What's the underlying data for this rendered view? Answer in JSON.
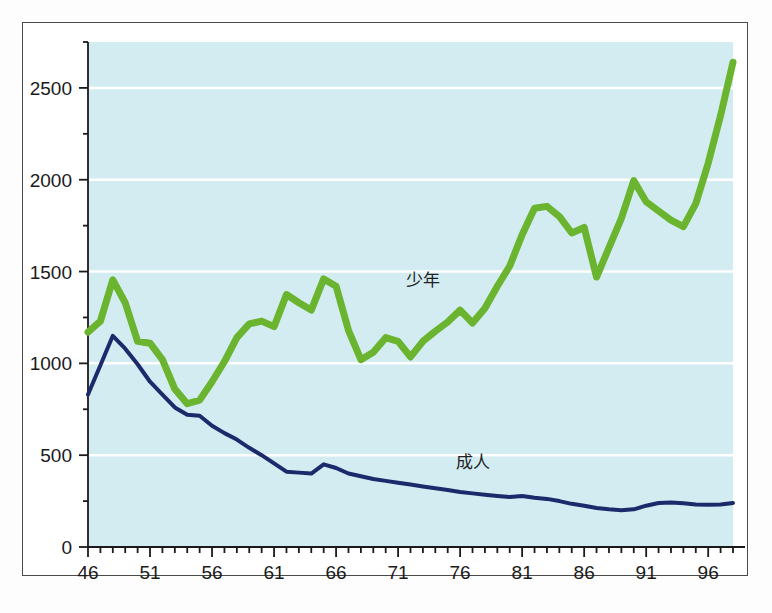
{
  "chart_data": {
    "type": "line",
    "title": "",
    "subtitle": "",
    "xlabel": "",
    "ylabel": "",
    "xlim": [
      46,
      98
    ],
    "ylim": [
      0,
      2750
    ],
    "grid": true,
    "grid_orientation": "horizontal",
    "legend_position": "inline-annotation",
    "plot_background_color": "#d3ecf2",
    "gridline_color": "#ffffff",
    "axis_color": "#1a1a1a",
    "y_ticks_major": [
      0,
      500,
      1000,
      1500,
      2000,
      2500
    ],
    "y_tick_labels": [
      "0",
      "500",
      "1000",
      "1500",
      "2000",
      "2500"
    ],
    "y_ticks_minor_step": 250,
    "x_ticks_major": [
      46,
      51,
      56,
      61,
      66,
      71,
      76,
      81,
      86,
      91,
      96
    ],
    "x_tick_labels": [
      "46",
      "51",
      "56",
      "61",
      "66",
      "71",
      "76",
      "81",
      "86",
      "91",
      "96"
    ],
    "x_ticks_minor_step": 1,
    "x": [
      46,
      47,
      48,
      49,
      50,
      51,
      52,
      53,
      54,
      55,
      56,
      57,
      58,
      59,
      60,
      61,
      62,
      63,
      64,
      65,
      66,
      67,
      68,
      69,
      70,
      71,
      72,
      73,
      74,
      75,
      76,
      77,
      78,
      79,
      80,
      81,
      82,
      83,
      84,
      85,
      86,
      87,
      88,
      89,
      90,
      91,
      92,
      93,
      94,
      95,
      96,
      97,
      98
    ],
    "series": [
      {
        "name": "少年",
        "label": "少年",
        "label_romaji": "shounen",
        "label_meaning": "juvenile",
        "color": "#6ab42f",
        "line_width": 7,
        "annotation_x": 73,
        "annotation_y": 1420,
        "values": [
          1170,
          1230,
          1455,
          1330,
          1120,
          1110,
          1020,
          860,
          780,
          800,
          900,
          1010,
          1140,
          1215,
          1230,
          1200,
          1375,
          1330,
          1290,
          1460,
          1420,
          1180,
          1020,
          1060,
          1140,
          1120,
          1035,
          1120,
          1175,
          1225,
          1290,
          1220,
          1300,
          1420,
          1530,
          1700,
          1845,
          1855,
          1800,
          1710,
          1740,
          1470,
          1630,
          1790,
          1995,
          1880,
          1830,
          1780,
          1745,
          1870,
          2090,
          2350,
          2640
        ]
      },
      {
        "name": "成人",
        "label": "成人",
        "label_romaji": "seijin",
        "label_meaning": "adult",
        "color": "#1c2a6b",
        "line_width": 4,
        "annotation_x": 77,
        "annotation_y": 430,
        "values": [
          830,
          990,
          1150,
          1080,
          995,
          900,
          830,
          760,
          720,
          715,
          660,
          620,
          585,
          540,
          500,
          455,
          410,
          405,
          400,
          450,
          430,
          400,
          385,
          370,
          360,
          350,
          340,
          330,
          320,
          310,
          300,
          292,
          285,
          278,
          272,
          278,
          268,
          262,
          250,
          235,
          225,
          212,
          205,
          200,
          205,
          225,
          240,
          242,
          238,
          232,
          230,
          232,
          240
        ]
      }
    ]
  },
  "figure": {
    "frame_border_color": "#4a4a4a",
    "page_background": "#ffffff"
  }
}
